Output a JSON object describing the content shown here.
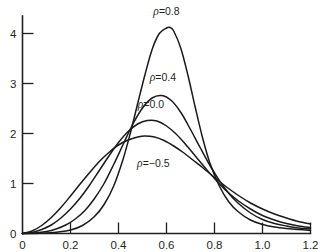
{
  "chart_data": {
    "type": "line",
    "title": "",
    "subtitle": "",
    "xlabel": "",
    "ylabel": "",
    "xlim": [
      0,
      1.2
    ],
    "ylim": [
      0,
      4.4
    ],
    "xticks": [
      "0",
      "0.2",
      "0.4",
      "0.6",
      "0.8",
      "1.0",
      "1.2"
    ],
    "xtick_values": [
      0,
      0.2,
      0.4,
      0.6,
      0.8,
      1.0,
      1.2
    ],
    "yticks": [
      "0",
      "1",
      "2",
      "3",
      "4"
    ],
    "ytick_values": [
      0,
      1,
      2,
      3,
      4
    ],
    "grid": false,
    "legend": "inline-annotations",
    "series": [
      {
        "name": "rho = 0.8",
        "label_text": "=0.8",
        "label_symbol": "ρ",
        "label_x": 0.6,
        "label_y": 4.38,
        "peak_x": 0.615,
        "peak_y": 4.12,
        "x": [
          0.0,
          0.05,
          0.1,
          0.15,
          0.2,
          0.25,
          0.3,
          0.34,
          0.38,
          0.42,
          0.45,
          0.48,
          0.51,
          0.54,
          0.57,
          0.6,
          0.615,
          0.63,
          0.66,
          0.69,
          0.72,
          0.75,
          0.78,
          0.82,
          0.86,
          0.9,
          0.95,
          1.0,
          1.05,
          1.1,
          1.15,
          1.2
        ],
        "y": [
          0.0,
          0.0,
          0.01,
          0.03,
          0.07,
          0.16,
          0.34,
          0.58,
          0.95,
          1.5,
          2.02,
          2.6,
          3.17,
          3.68,
          4.0,
          4.11,
          4.12,
          4.05,
          3.7,
          3.15,
          2.52,
          1.92,
          1.42,
          0.95,
          0.63,
          0.43,
          0.27,
          0.18,
          0.13,
          0.1,
          0.08,
          0.06
        ]
      },
      {
        "name": "rho = 0.4",
        "label_text": "=0.4",
        "label_symbol": "ρ",
        "label_x": 0.585,
        "label_y": 3.05,
        "peak_x": 0.583,
        "peak_y": 2.76,
        "x": [
          0.0,
          0.05,
          0.1,
          0.14,
          0.18,
          0.22,
          0.26,
          0.3,
          0.34,
          0.38,
          0.42,
          0.46,
          0.5,
          0.54,
          0.58,
          0.62,
          0.66,
          0.7,
          0.74,
          0.78,
          0.82,
          0.86,
          0.9,
          0.95,
          1.0,
          1.05,
          1.1,
          1.15,
          1.2
        ],
        "y": [
          0.0,
          0.01,
          0.04,
          0.09,
          0.17,
          0.29,
          0.46,
          0.7,
          1.0,
          1.38,
          1.79,
          2.19,
          2.51,
          2.71,
          2.76,
          2.66,
          2.42,
          2.08,
          1.72,
          1.37,
          1.06,
          0.8,
          0.6,
          0.41,
          0.28,
          0.2,
          0.15,
          0.11,
          0.09
        ]
      },
      {
        "name": "rho = 0.0",
        "label_text": "=0.0",
        "label_symbol": "ρ",
        "label_x": 0.535,
        "label_y": 2.52,
        "peak_x": 0.552,
        "peak_y": 2.26,
        "x": [
          0.0,
          0.04,
          0.08,
          0.12,
          0.16,
          0.2,
          0.24,
          0.28,
          0.32,
          0.36,
          0.4,
          0.44,
          0.48,
          0.52,
          0.56,
          0.6,
          0.64,
          0.68,
          0.72,
          0.76,
          0.8,
          0.85,
          0.9,
          0.95,
          1.0,
          1.05,
          1.1,
          1.15,
          1.2
        ],
        "y": [
          0.0,
          0.02,
          0.08,
          0.17,
          0.31,
          0.49,
          0.71,
          0.97,
          1.26,
          1.55,
          1.82,
          2.04,
          2.19,
          2.26,
          2.25,
          2.15,
          1.99,
          1.78,
          1.55,
          1.32,
          1.1,
          0.85,
          0.65,
          0.49,
          0.36,
          0.27,
          0.2,
          0.15,
          0.12
        ]
      },
      {
        "name": "rho = -0.5",
        "label_text": "=−0.5",
        "label_symbol": "ρ",
        "label_x": 0.545,
        "label_y": 1.33,
        "peak_x": 0.508,
        "peak_y": 1.95,
        "x": [
          0.0,
          0.04,
          0.08,
          0.12,
          0.16,
          0.2,
          0.24,
          0.28,
          0.32,
          0.36,
          0.4,
          0.44,
          0.48,
          0.51,
          0.55,
          0.59,
          0.63,
          0.67,
          0.71,
          0.75,
          0.8,
          0.85,
          0.9,
          0.95,
          1.0,
          1.05,
          1.1,
          1.15,
          1.2
        ],
        "y": [
          0.0,
          0.05,
          0.16,
          0.32,
          0.52,
          0.75,
          0.99,
          1.22,
          1.44,
          1.62,
          1.77,
          1.87,
          1.93,
          1.95,
          1.93,
          1.86,
          1.75,
          1.62,
          1.47,
          1.32,
          1.12,
          0.93,
          0.76,
          0.61,
          0.49,
          0.39,
          0.31,
          0.24,
          0.19
        ]
      }
    ]
  },
  "style": {
    "axis_color": "#231f20",
    "curve_color": "#1a1a1a",
    "background": "#ffffff"
  }
}
